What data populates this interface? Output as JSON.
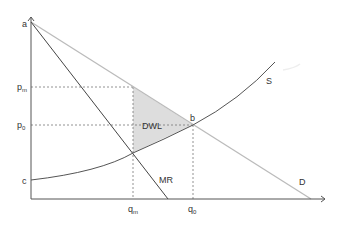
{
  "diagram": {
    "points": {
      "a": {
        "label": "a",
        "x": 31,
        "y": 22
      },
      "b": {
        "label": "b",
        "x": 193,
        "y": 125
      },
      "c": {
        "label": "c",
        "x": 31,
        "y": 180
      },
      "mr_s": {
        "x": 133,
        "y": 153
      }
    },
    "axes": {
      "y_labels": [
        {
          "id": "a",
          "text": "a",
          "y": 24
        },
        {
          "id": "pm",
          "base": "p",
          "sub": "m",
          "y": 89
        },
        {
          "id": "p0",
          "base": "p",
          "sub": "0",
          "y": 127
        },
        {
          "id": "c",
          "text": "c",
          "y": 183
        }
      ],
      "x_labels": [
        {
          "id": "qm",
          "base": "q",
          "sub": "m",
          "x": 133
        },
        {
          "id": "q0",
          "base": "q",
          "sub": "0",
          "x": 193
        }
      ]
    },
    "curves": {
      "S": {
        "label": "S"
      },
      "D": {
        "label": "D"
      },
      "MR": {
        "label": "MR"
      }
    },
    "region": {
      "label": "DWL"
    },
    "colors": {
      "axis": "#555555",
      "demand": "#bbbbbb",
      "supply": "#555555",
      "mr": "#444444",
      "dwl_fill": "#dddddd",
      "dashed": "#777777"
    }
  }
}
